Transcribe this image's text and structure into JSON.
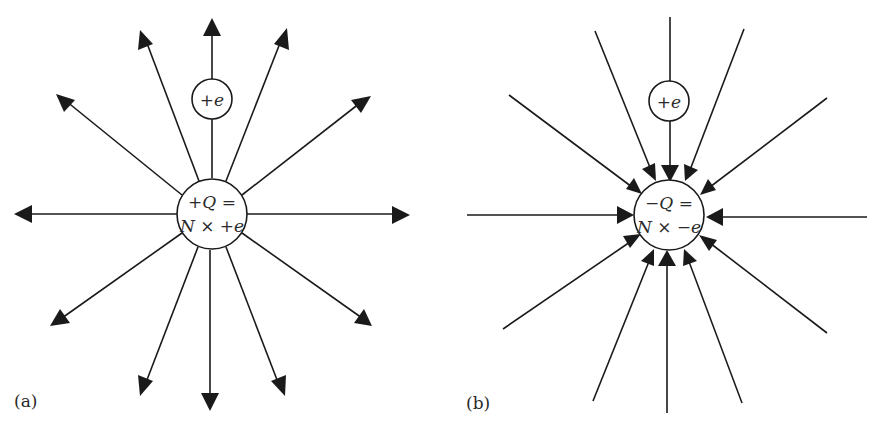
{
  "figure": {
    "panels": [
      {
        "id": "a",
        "label": "(a)",
        "center_charge": {
          "line1": "+Q =",
          "line2": "N × +e"
        },
        "test_charge": "+e",
        "field_direction": "outward",
        "line_count": 12
      },
      {
        "id": "b",
        "label": "(b)",
        "center_charge": {
          "line1": "−Q =",
          "line2": "N × −e"
        },
        "test_charge": "+e",
        "field_direction": "inward",
        "line_count": 12
      }
    ],
    "colors": {
      "line": "#1a1a1a",
      "background": "#ffffff",
      "text": "#2a2a2a"
    }
  }
}
